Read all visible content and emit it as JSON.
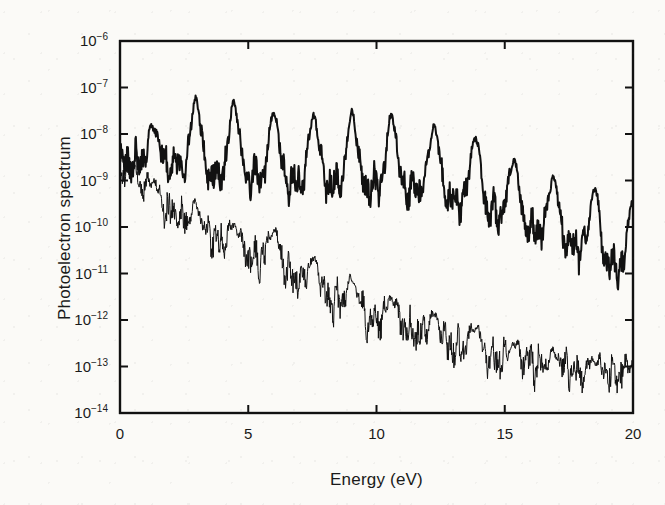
{
  "chart_data": {
    "type": "line",
    "title": "",
    "xlabel": "Energy (eV)",
    "ylabel": "Photoelectron spectrum",
    "xlim": [
      0,
      20
    ],
    "ylim": [
      1e-14,
      1e-06
    ],
    "yscale": "log",
    "xscale": "linear",
    "grid": false,
    "legend": "none",
    "xticks": [
      "0",
      "5",
      "10",
      "15",
      "20"
    ],
    "xtick_values": [
      0,
      5,
      10,
      15,
      20
    ],
    "ytick_exponents": [
      -6,
      -7,
      -8,
      -9,
      -10,
      -11,
      -12,
      -13,
      -14
    ],
    "ytick_labels": [
      "10-6",
      "10-7",
      "10-8",
      "10-9",
      "10-10",
      "10-11",
      "10-12",
      "10-13",
      "10-14"
    ],
    "peak_spacing_ev": 1.55,
    "series": [
      {
        "name": "upper-spectrum",
        "style": "bold",
        "line_width": 2.0,
        "color": "#111111",
        "peak_x": [
          1.3,
          2.95,
          4.45,
          6.0,
          7.55,
          9.05,
          10.6,
          12.25,
          13.85,
          15.35,
          16.9,
          18.5,
          20.0
        ],
        "peak_y": [
          1.4e-08,
          6e-08,
          5e-08,
          3.2e-08,
          2.6e-08,
          3e-08,
          2.6e-08,
          1.6e-08,
          9e-09,
          3e-09,
          1.2e-09,
          7e-10,
          4.5e-10
        ],
        "baseline_y": [
          2.5e-09,
          1.6e-09,
          1.2e-09,
          1e-09,
          9e-10,
          8e-10,
          7e-10,
          5e-10,
          3e-10,
          1.4e-10,
          6e-11,
          2.2e-11,
          9e-12
        ]
      },
      {
        "name": "lower-spectrum",
        "style": "thin",
        "line_width": 1.0,
        "color": "#111111",
        "peak_x": [
          0.5,
          1.3,
          2.95,
          4.45,
          6.0,
          7.55,
          9.05,
          10.6,
          12.25,
          13.85,
          15.35,
          16.9,
          18.5,
          20.0
        ],
        "peak_y": [
          2e-09,
          1e-09,
          3e-10,
          1.1e-10,
          9e-11,
          2e-11,
          7e-12,
          3e-12,
          1.3e-12,
          7e-13,
          3e-13,
          2e-13,
          1.4e-13,
          1.2e-13
        ],
        "baseline_y": [
          1e-09,
          4e-10,
          8e-11,
          3e-11,
          1.5e-11,
          4e-12,
          1.6e-12,
          7e-13,
          3.5e-13,
          2e-13,
          1.2e-13,
          9e-14,
          7e-14,
          6e-14
        ]
      }
    ]
  },
  "axes": {
    "frame_color": "#111111",
    "tick_direction": "in"
  }
}
